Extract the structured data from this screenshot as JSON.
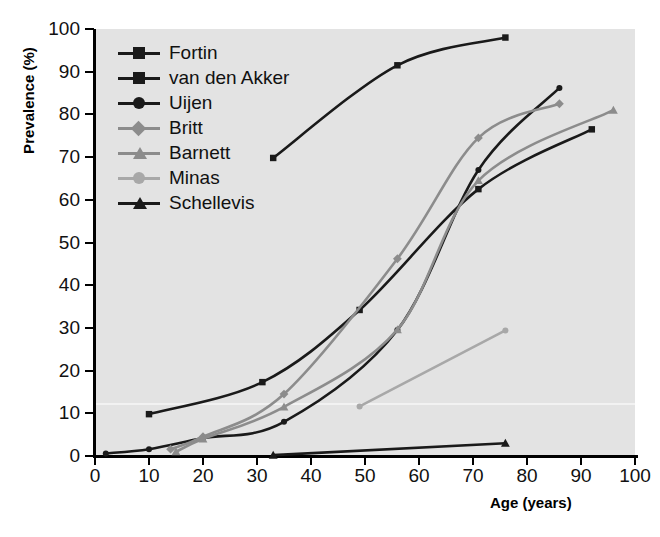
{
  "axes": {
    "ylabel": "Prevalence (%)",
    "xlabel": "Age (years)",
    "yticks": [
      "0",
      "10",
      "20",
      "30",
      "40",
      "50",
      "60",
      "70",
      "80",
      "90",
      "100"
    ],
    "xticks": [
      "0",
      "10",
      "20",
      "30",
      "40",
      "50",
      "60",
      "70",
      "80",
      "90",
      "100"
    ]
  },
  "legend": {
    "items": [
      {
        "label": "Fortin",
        "marker": "square",
        "color": "#1a1a1a"
      },
      {
        "label": "van den Akker",
        "marker": "square",
        "color": "#1a1a1a"
      },
      {
        "label": "Uijen",
        "marker": "circle",
        "color": "#1a1a1a"
      },
      {
        "label": "Britt",
        "marker": "diamond",
        "color": "#8c8c8c"
      },
      {
        "label": "Barnett",
        "marker": "triangle",
        "color": "#8c8c8c"
      },
      {
        "label": "Minas",
        "marker": "circle",
        "color": "#a8a8a8"
      },
      {
        "label": "Schellevis",
        "marker": "triangle",
        "color": "#1a1a1a"
      }
    ]
  },
  "chart_data": {
    "type": "line",
    "title": "",
    "xlabel": "Age (years)",
    "ylabel": "Prevalence (%)",
    "xlim": [
      0,
      100
    ],
    "ylim": [
      0,
      100
    ],
    "grid": false,
    "legend_position": "top-left-inside",
    "plot_background": "#e3e3e3",
    "series": [
      {
        "name": "Fortin",
        "marker": "square",
        "color": "#1a1a1a",
        "points": [
          [
            33,
            69.8
          ],
          [
            56,
            91.5
          ],
          [
            76,
            98.0
          ]
        ]
      },
      {
        "name": "van den Akker",
        "marker": "square",
        "color": "#1a1a1a",
        "points": [
          [
            10,
            9.8
          ],
          [
            31,
            17.3
          ],
          [
            49,
            34.2
          ],
          [
            71,
            62.5
          ],
          [
            92,
            76.5
          ]
        ]
      },
      {
        "name": "Uijen",
        "marker": "circle",
        "color": "#1a1a1a",
        "points": [
          [
            2,
            0.6
          ],
          [
            10,
            1.6
          ],
          [
            20,
            4.2
          ],
          [
            35,
            8.0
          ],
          [
            56,
            29.5
          ],
          [
            71,
            67.0
          ],
          [
            86,
            86.2
          ]
        ]
      },
      {
        "name": "Britt",
        "marker": "diamond",
        "color": "#8c8c8c",
        "points": [
          [
            14,
            1.6
          ],
          [
            20,
            4.5
          ],
          [
            35,
            14.5
          ],
          [
            56,
            46.2
          ],
          [
            71,
            74.5
          ],
          [
            86,
            82.5
          ]
        ]
      },
      {
        "name": "Barnett",
        "marker": "triangle",
        "color": "#8c8c8c",
        "points": [
          [
            15,
            1.0
          ],
          [
            20,
            4.0
          ],
          [
            35,
            11.5
          ],
          [
            56,
            29.6
          ],
          [
            71,
            64.5
          ],
          [
            96,
            81.0
          ]
        ]
      },
      {
        "name": "Minas",
        "marker": "circle",
        "color": "#a8a8a8",
        "points": [
          [
            49,
            11.6
          ],
          [
            76,
            29.4
          ]
        ]
      },
      {
        "name": "Schellevis",
        "marker": "triangle",
        "color": "#1a1a1a",
        "points": [
          [
            33,
            0.2
          ],
          [
            76,
            3.0
          ]
        ]
      }
    ]
  }
}
